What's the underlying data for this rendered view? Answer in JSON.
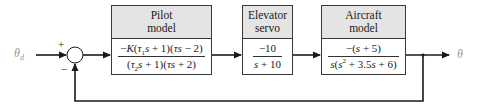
{
  "diagram": {
    "type": "feedback-control-block-diagram",
    "input_label": "θd",
    "output_label": "θ",
    "summing_junction": {
      "plus_sign": "+",
      "minus_sign": "−"
    },
    "blocks": [
      {
        "title_line1": "Pilot",
        "title_line2": "model",
        "numerator": "−K(τ1s + 1)(τs − 2)",
        "denominator": "(τ2s + 1)(τs + 2)"
      },
      {
        "title_line1": "Elevator",
        "title_line2": "servo",
        "numerator": "−10",
        "denominator": "s + 10"
      },
      {
        "title_line1": "Aircraft",
        "title_line2": "model",
        "numerator": "−(s + 5)",
        "denominator": "s(s² + 3.5s + 6)"
      }
    ],
    "feedback": "unity negative feedback from θ to summing junction",
    "colors": {
      "line": "#1a1a1a",
      "header_fill": "#e4e4e4",
      "label": "#9a9a9a"
    }
  }
}
